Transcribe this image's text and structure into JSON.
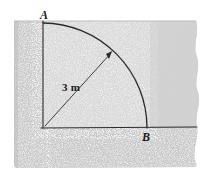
{
  "figure": {
    "type": "engineering-diagram",
    "labels": {
      "point_a": "A",
      "point_b": "B",
      "radius": "3 m"
    },
    "geometry": {
      "origin": {
        "x": 43,
        "y": 128
      },
      "point_a": {
        "x": 43,
        "y": 23
      },
      "point_b": {
        "x": 147,
        "y": 128
      },
      "radius_px": 105,
      "arrow_tip": {
        "x": 112,
        "y": 52
      },
      "arc_sweep_degrees": 90
    },
    "colors": {
      "line": "#2b2b2b",
      "slab_light": "#dcdcdc",
      "slab_mid": "#cfcfcf",
      "slab_speckle": "#c6c6c6",
      "speckle_highlight": "#f2f2f2",
      "background": "#ffffff",
      "label_text": "#1a1a1a"
    },
    "regions": {
      "upper_right_panel": "smooth light grey concrete face",
      "left_and_bottom_panel": "speckled aggregate concrete face",
      "quarter_circle": "lighter sector bounded by arc A-B"
    }
  }
}
